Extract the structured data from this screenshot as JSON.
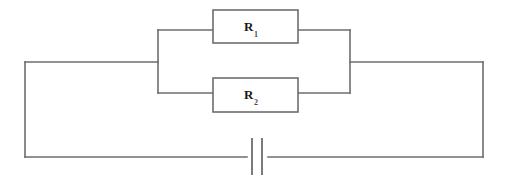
{
  "figure": {
    "type": "circuit-diagram",
    "background_color": "#ffffff",
    "line_color": "#6d6d6d",
    "label_color": "#1a1a1a"
  },
  "components": {
    "resistor_1": {
      "symbol": "R",
      "subscript": "1",
      "full_label": "R1",
      "shape": "rectangle",
      "x": 213,
      "y": 10,
      "width": 85,
      "height": 33,
      "branch": "top"
    },
    "resistor_2": {
      "symbol": "R",
      "subscript": "2",
      "full_label": "R2",
      "shape": "rectangle",
      "x": 213,
      "y": 78,
      "width": 85,
      "height": 34,
      "branch": "bottom"
    },
    "battery": {
      "name": "battery",
      "symbol": "cell",
      "long_plate_x": 252,
      "short_plate_x": 262,
      "plate_top_y": 138,
      "plate_bottom_y": 175,
      "gap_left_x": 247,
      "gap_right_x": 268
    }
  },
  "wires": {
    "outer_left_top": "M 25 62 L 158 62",
    "outer_left_down": "M 25 62 L 25 157",
    "outer_bottom_left": "M 25 157 L 247 157",
    "outer_bottom_right": "M 268 157 L 483 157",
    "outer_right_up": "M 483 157 L 483 62",
    "outer_right_top": "M 350 62 L 483 62",
    "left_node_bus": "M 158 30 L 158 93",
    "right_node_bus": "M 350 30 L 350 93",
    "top_branch_left": "M 158 30 L 213 30",
    "top_branch_right": "M 298 30 L 350 30",
    "bottom_branch_left": "M 158 93 L 213 93",
    "bottom_branch_right": "M 298 93 L 350 93"
  }
}
